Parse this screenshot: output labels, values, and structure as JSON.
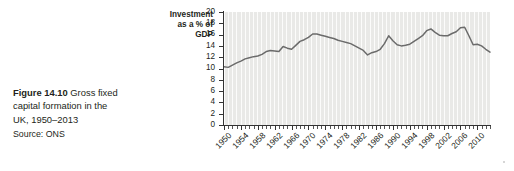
{
  "caption": {
    "figure_number": "Figure 14.10",
    "line1_rest": " Gross fixed",
    "line2": "capital formation in the",
    "line3": "UK, 1950–2013",
    "source": "Source: ONS"
  },
  "chart_data": {
    "type": "line",
    "title": "",
    "subtitle": "",
    "xlabel": "",
    "ylabel": "Investment as a % of GDP",
    "ylabel_lines": [
      "Investment",
      "as a % of",
      "GDP"
    ],
    "ylim": [
      0,
      20
    ],
    "ytick_step": 2,
    "yticks": [
      20,
      18,
      16,
      14,
      12,
      10,
      8,
      6,
      4,
      2,
      0
    ],
    "xlim": [
      1950,
      2013
    ],
    "xtick_step": 4,
    "xticks": [
      1950,
      1954,
      1958,
      1962,
      1966,
      1970,
      1974,
      1978,
      1982,
      1986,
      1990,
      1994,
      1998,
      2002,
      2006,
      2010
    ],
    "x_minor_step": 1,
    "grid": "vertical-only",
    "legend": "none",
    "line_color": "#6b6b6b",
    "plot_bg_color": "#e9e9e7",
    "axis_color": "#333333",
    "x": [
      1950,
      1951,
      1952,
      1953,
      1954,
      1955,
      1956,
      1957,
      1958,
      1959,
      1960,
      1961,
      1962,
      1963,
      1964,
      1965,
      1966,
      1967,
      1968,
      1969,
      1970,
      1971,
      1972,
      1973,
      1974,
      1975,
      1976,
      1977,
      1978,
      1979,
      1980,
      1981,
      1982,
      1983,
      1984,
      1985,
      1986,
      1987,
      1988,
      1989,
      1990,
      1991,
      1992,
      1993,
      1994,
      1995,
      1996,
      1997,
      1998,
      1999,
      2000,
      2001,
      2002,
      2003,
      2004,
      2005,
      2006,
      2007,
      2008,
      2009,
      2010,
      2011,
      2012,
      2013
    ],
    "values": [
      10.3,
      10.2,
      10.6,
      11.0,
      11.3,
      11.7,
      11.9,
      12.1,
      12.2,
      12.5,
      13.0,
      13.2,
      13.1,
      13.0,
      13.9,
      13.6,
      13.4,
      14.1,
      14.8,
      15.1,
      15.5,
      16.1,
      16.1,
      15.9,
      15.7,
      15.5,
      15.3,
      15.0,
      14.8,
      14.6,
      14.4,
      14.0,
      13.6,
      13.2,
      12.4,
      12.8,
      13.0,
      13.4,
      14.4,
      15.8,
      14.9,
      14.2,
      14.0,
      14.1,
      14.3,
      14.8,
      15.3,
      15.8,
      16.7,
      17.0,
      16.4,
      15.9,
      15.8,
      15.8,
      16.2,
      16.5,
      17.2,
      17.3,
      15.8,
      14.2,
      14.3,
      14.0,
      13.4,
      12.9
    ],
    "series": [
      {
        "name": "Gross fixed capital formation (% of GDP)",
        "values": [
          10.3,
          10.2,
          10.6,
          11.0,
          11.3,
          11.7,
          11.9,
          12.1,
          12.2,
          12.5,
          13.0,
          13.2,
          13.1,
          13.0,
          13.9,
          13.6,
          13.4,
          14.1,
          14.8,
          15.1,
          15.5,
          16.1,
          16.1,
          15.9,
          15.7,
          15.5,
          15.3,
          15.0,
          14.8,
          14.6,
          14.4,
          14.0,
          13.6,
          13.2,
          12.4,
          12.8,
          13.0,
          13.4,
          14.4,
          15.8,
          14.9,
          14.2,
          14.0,
          14.1,
          14.3,
          14.8,
          15.3,
          15.8,
          16.7,
          17.0,
          16.4,
          15.9,
          15.8,
          15.8,
          16.2,
          16.5,
          17.2,
          17.3,
          15.8,
          14.2,
          14.3,
          14.0,
          13.4,
          12.9
        ]
      }
    ]
  }
}
